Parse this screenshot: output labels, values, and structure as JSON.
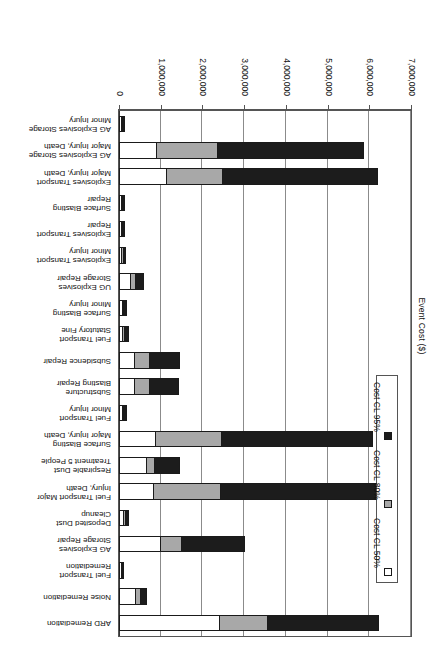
{
  "chart": {
    "axis_title": "Event Cost ($)",
    "tick_labels": [
      "0",
      "1,000,000",
      "2,000,000",
      "3,000,000",
      "4,000,000",
      "5,000,000",
      "6,000,000",
      "7,000,000"
    ],
    "legend": {
      "items": [
        {
          "label": "Cost CL 50%",
          "color": "#ffffff"
        },
        {
          "label": "Cost CL 80%",
          "color": "#a8a8a8"
        },
        {
          "label": "Cost CL 95%",
          "color": "#1c1c1c"
        }
      ]
    }
  },
  "chart_data": {
    "type": "bar",
    "orientation": "horizontal-stacked",
    "title": "",
    "xlabel": "Event Cost ($)",
    "ylabel": "",
    "xlim": [
      0,
      7000000
    ],
    "grid": true,
    "legend_position": "left-inside",
    "tick_values": [
      0,
      1000000,
      2000000,
      3000000,
      4000000,
      5000000,
      6000000,
      7000000
    ],
    "categories": [
      "ARD Remediation",
      "Noise Remediation",
      "Fuel Transport\nRemediation",
      "AG Explosives\nStorage Repair",
      "Deposited Dust\nCleanup",
      "Fuel Transport Major\nInjury, Death",
      "Respirable Dust\nTreatment 5 People",
      "Surface Blasting\nMajor Injury, Death",
      "Fuel Transport\nMinor Injury",
      "Substructure\nBlasting Repair",
      "Subsidence Repair",
      "Fuel Transport\nStatutory Fine",
      "Surface Blasting\nMinor Injury",
      "UG Explosives\nStorage Repair",
      "Explosives Transport\nMinor Injury",
      "Explosives Transport\nRepair",
      "Surface Blasting\nRepair",
      "Explosives Transport\nMajor Injury, Death",
      "AG Explosives Storage\nMajor Injury, Death",
      "AG Explosives Storage\nMinor Injury"
    ],
    "series": [
      {
        "name": "Cost CL 50%",
        "color": "#ffffff",
        "values": [
          2420000,
          400000,
          60000,
          1000000,
          130000,
          840000,
          680000,
          880000,
          90000,
          390000,
          390000,
          100000,
          90000,
          290000,
          80000,
          70000,
          60000,
          1140000,
          900000,
          70000
        ]
      },
      {
        "name": "Cost CL 80%",
        "color": "#a8a8a8",
        "values": [
          3570000,
          520000,
          90000,
          1520000,
          170000,
          2440000,
          860000,
          2460000,
          120000,
          740000,
          740000,
          140000,
          120000,
          400000,
          110000,
          95000,
          85000,
          2490000,
          2380000,
          95000
        ]
      },
      {
        "name": "Cost CL 95%",
        "color": "#1c1c1c",
        "values": [
          6240000,
          660000,
          130000,
          3010000,
          250000,
          6150000,
          1460000,
          6080000,
          180000,
          1450000,
          1460000,
          230000,
          180000,
          590000,
          170000,
          150000,
          140000,
          6210000,
          5880000,
          150000
        ]
      }
    ]
  }
}
